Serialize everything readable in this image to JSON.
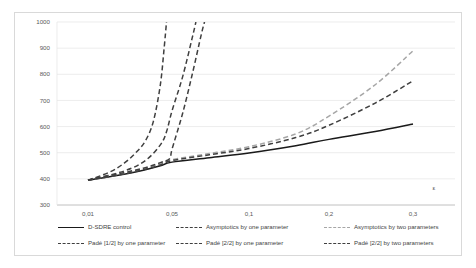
{
  "chart_data": {
    "type": "line",
    "title": "",
    "subtitle": "",
    "xlabel": "ε",
    "ylabel": "",
    "xlim": [
      0.01,
      0.3
    ],
    "ylim": [
      300,
      1000
    ],
    "grid": true,
    "x_scale": "nonlinear-category",
    "legend_position": "bottom",
    "xticks": [
      "0,01",
      "0,05",
      "0,1",
      "0,2",
      "0,3"
    ],
    "xtick_values": [
      0.01,
      0.05,
      0.1,
      0.2,
      0.3
    ],
    "yticks": [
      "300",
      "400",
      "500",
      "600",
      "700",
      "800",
      "900",
      "1000"
    ],
    "ytick_values": [
      300,
      400,
      500,
      600,
      700,
      800,
      900,
      1000
    ],
    "series": [
      {
        "name": "D-SDRE control",
        "style": "solid",
        "color": "#1a1a1a",
        "width": 1.5,
        "x": [
          0.01,
          0.02,
          0.03,
          0.04,
          0.05,
          0.07,
          0.1,
          0.15,
          0.2,
          0.25,
          0.3
        ],
        "values": [
          395,
          418,
          435,
          450,
          464,
          481,
          499,
          527,
          551,
          581,
          610
        ]
      },
      {
        "name": "Asymptotics by one parameter",
        "style": "dashed",
        "color": "#3f3f3f",
        "width": 1.5,
        "x": [
          0.01,
          0.02,
          0.03,
          0.04,
          0.045,
          0.05,
          0.055,
          0.06,
          0.062
        ],
        "values": [
          395,
          430,
          470,
          530,
          580,
          660,
          790,
          940,
          1000
        ]
      },
      {
        "name": "Asymptotics by two parameters",
        "style": "dashed",
        "color": "#a6a6a6",
        "width": 1.5,
        "x": [
          0.01,
          0.02,
          0.03,
          0.04,
          0.05,
          0.07,
          0.1,
          0.15,
          0.2,
          0.25,
          0.3
        ],
        "values": [
          395,
          421,
          440,
          457,
          473,
          497,
          523,
          572,
          640,
          760,
          890
        ]
      },
      {
        "name": "Padé [1/2] by one parameter",
        "style": "dashed",
        "color": "#3f3f3f",
        "width": 1.5,
        "x": [
          0.01,
          0.015,
          0.02,
          0.025,
          0.03,
          0.035,
          0.04,
          0.043,
          0.045
        ],
        "values": [
          395,
          425,
          460,
          500,
          545,
          620,
          760,
          900,
          1000
        ]
      },
      {
        "name": "Padé [2/2] by one parameter",
        "style": "dashed",
        "color": "#3f3f3f",
        "width": 1.5,
        "x": [
          0.01,
          0.02,
          0.03,
          0.04,
          0.048,
          0.05,
          0.055,
          0.06,
          0.065,
          0.067
        ],
        "values": [
          395,
          424,
          443,
          462,
          478,
          513,
          650,
          800,
          950,
          1000
        ]
      },
      {
        "name": "Padé [2/2] by two parameters",
        "style": "dashed",
        "color": "#3f3f3f",
        "width": 1.5,
        "x": [
          0.01,
          0.02,
          0.03,
          0.04,
          0.05,
          0.07,
          0.1,
          0.15,
          0.2,
          0.25,
          0.3
        ],
        "values": [
          395,
          419,
          437,
          453,
          470,
          492,
          516,
          558,
          605,
          690,
          775
        ]
      }
    ]
  },
  "legend": {
    "items": [
      {
        "label": "D-SDRE control",
        "style": "solid",
        "color": "#1a1a1a"
      },
      {
        "label": "Asymptotics by one parameter",
        "style": "dashed",
        "color": "#3f3f3f"
      },
      {
        "label": "Asymptotics by two parameters",
        "style": "dashed",
        "color": "#a6a6a6"
      },
      {
        "label": "Padé [1/2] by one parameter",
        "style": "dashed",
        "color": "#3f3f3f"
      },
      {
        "label": "Padé [2/2] by one parameter",
        "style": "dashed",
        "color": "#3f3f3f"
      },
      {
        "label": "Padé [2/2] by two parameters",
        "style": "dashed",
        "color": "#3f3f3f"
      }
    ]
  }
}
